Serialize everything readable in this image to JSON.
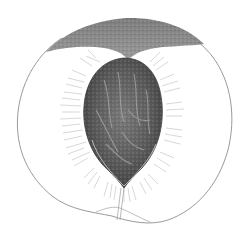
{
  "image": {
    "subject": "Botanical illustration of a halved peach showing the pit",
    "width": 244,
    "height": 239,
    "background": "#ffffff"
  },
  "colors": {
    "outline": "#8a8a8a",
    "skin_top": "#7a7a7a",
    "pit_dark": "#4a4a4a",
    "pit_mid": "#666666",
    "pit_light": "#9a9a9a",
    "fibers": "#b0b0b0",
    "stem_line": "#9a9a9a"
  }
}
